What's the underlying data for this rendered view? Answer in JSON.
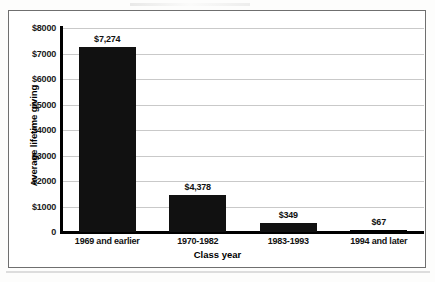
{
  "chart_data": {
    "type": "bar",
    "title": "",
    "xlabel": "Class year",
    "ylabel": "Average lifetime giving",
    "categories": [
      "1969 and earlier",
      "1970-1982",
      "1983-1993",
      "1994 and later"
    ],
    "values": [
      7274,
      1450,
      349,
      67
    ],
    "data_labels": [
      "$7,274",
      "$4,378",
      "$349",
      "$67"
    ],
    "ylim": [
      0,
      8000
    ],
    "ytick_values": [
      8000,
      7000,
      6000,
      5000,
      4000,
      3000,
      2000,
      1000,
      0
    ],
    "ytick_labels": [
      "$8000",
      "$7000",
      "$6000",
      "$5000",
      "$4000",
      "$3000",
      "$2000",
      "$1000",
      "0"
    ],
    "grid": true,
    "legend": false,
    "bar_color": "#111111",
    "gridline_color": "#c9c9c9",
    "axis_color": "#000000"
  }
}
